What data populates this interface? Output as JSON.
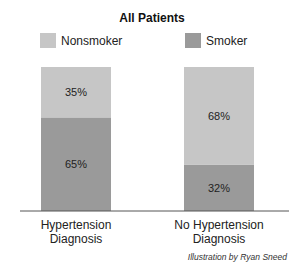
{
  "chart_data": {
    "type": "bar",
    "stacked": true,
    "percent": true,
    "title": "All Patients",
    "categories": [
      "Hypertension\nDiagnosis",
      "No Hypertension\nDiagnosis"
    ],
    "series": [
      {
        "name": "Smoker",
        "values": [
          65,
          32
        ],
        "color": "#9a9a9a"
      },
      {
        "name": "Nonsmoker",
        "values": [
          35,
          68
        ],
        "color": "#c6c6c6"
      }
    ],
    "legend": [
      {
        "name": "Nonsmoker",
        "color": "#c6c6c6"
      },
      {
        "name": "Smoker",
        "color": "#9a9a9a"
      }
    ],
    "legend_position": "top",
    "ylim": [
      0,
      100
    ],
    "xlabel": "",
    "ylabel": "",
    "grid": false,
    "credit": "Illustration by Ryan Sneed"
  }
}
